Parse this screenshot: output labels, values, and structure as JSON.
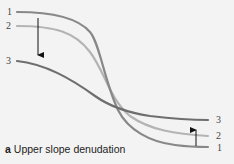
{
  "figure": {
    "caption_letter": "a",
    "caption_text": "Upper slope denudation",
    "curves": [
      {
        "id": "1",
        "label_left": "1",
        "label_right": "1",
        "color": "#888888"
      },
      {
        "id": "2",
        "label_left": "2",
        "label_right": "2",
        "color": "#b4b4b4"
      },
      {
        "id": "3",
        "label_left": "3",
        "label_right": "3",
        "color": "#6e6e6e"
      }
    ],
    "arrows": [
      {
        "id": "down-arrow",
        "direction": "down",
        "meaning": "upper slope lowering"
      },
      {
        "id": "up-arrow",
        "direction": "up",
        "meaning": "lower slope accumulation"
      }
    ],
    "background": "#f3f3f3"
  }
}
